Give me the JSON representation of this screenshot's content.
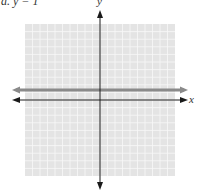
{
  "problem": {
    "label": "a. y = 1"
  },
  "chart_data": {
    "type": "line",
    "title": "a. y = 1",
    "xlabel": "x",
    "ylabel": "y",
    "xlim": [
      -10,
      10
    ],
    "ylim": [
      -10,
      10
    ],
    "grid": true,
    "grid_cells": 20,
    "series": [
      {
        "name": "y = 1",
        "equation": "y = 1",
        "x": [
          -10,
          10
        ],
        "y": [
          1,
          1
        ],
        "color": "#8a8a8a"
      }
    ]
  },
  "axes": {
    "x_label": "x",
    "y_label": "y"
  },
  "colors": {
    "grid_bg": "#e4e4e4",
    "grid_line": "#f7f7f7",
    "axis": "#1a1a1a",
    "graph_line": "#8a8a8a"
  }
}
